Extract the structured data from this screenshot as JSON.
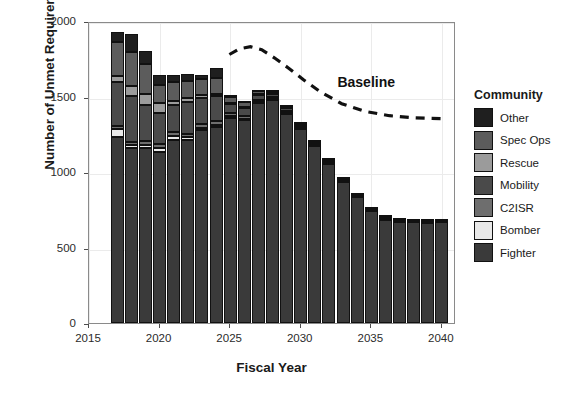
{
  "chart_data": {
    "type": "bar",
    "stacked": true,
    "title": "",
    "xlabel": "Fiscal Year",
    "ylabel": "Number of Unmet Requirements",
    "xlim": [
      2015.0,
      2041.0
    ],
    "ylim": [
      0,
      2000
    ],
    "xticks": [
      2015,
      2020,
      2025,
      2030,
      2035,
      2040
    ],
    "yticks": [
      0,
      500,
      1000,
      1500,
      2000
    ],
    "grid": true,
    "legend_title": "Community",
    "legend_position": "right",
    "categories": [
      2017,
      2018,
      2019,
      2020,
      2021,
      2022,
      2023,
      2024,
      2025,
      2026,
      2027,
      2028,
      2029,
      2030,
      2031,
      2032,
      2033,
      2034,
      2035,
      2036,
      2037,
      2038,
      2039,
      2040
    ],
    "series": [
      {
        "name": "Fighter",
        "color": "#3a3a3a",
        "values": [
          1235,
          1160,
          1160,
          1130,
          1215,
          1210,
          1280,
          1300,
          1360,
          1345,
          1460,
          1480,
          1390,
          1290,
          1180,
          1060,
          940,
          840,
          745,
          690,
          675,
          672,
          670,
          672
        ]
      },
      {
        "name": "Bomber",
        "color": "#e8e8e8",
        "values": [
          48,
          22,
          20,
          28,
          22,
          20,
          14,
          14,
          10,
          8,
          6,
          4,
          4,
          2,
          2,
          2,
          2,
          2,
          2,
          2,
          2,
          2,
          2,
          2
        ]
      },
      {
        "name": "C2ISR",
        "color": "#6e6e6e",
        "values": [
          22,
          18,
          26,
          30,
          26,
          24,
          22,
          22,
          18,
          16,
          14,
          12,
          10,
          8,
          6,
          6,
          4,
          4,
          4,
          4,
          4,
          4,
          4,
          4
        ]
      },
      {
        "name": "Mobility",
        "color": "#4a4a4a",
        "values": [
          290,
          305,
          235,
          205,
          180,
          210,
          175,
          165,
          60,
          52,
          30,
          22,
          18,
          14,
          12,
          10,
          8,
          6,
          6,
          6,
          4,
          4,
          4,
          4
        ]
      },
      {
        "name": "Rescue",
        "color": "#9b9b9b",
        "values": [
          40,
          62,
          78,
          66,
          30,
          26,
          18,
          16,
          12,
          10,
          8,
          6,
          6,
          4,
          4,
          4,
          2,
          2,
          2,
          2,
          2,
          2,
          2,
          2
        ]
      },
      {
        "name": "Spec Ops",
        "color": "#5c5c5c",
        "values": [
          225,
          230,
          195,
          120,
          120,
          110,
          105,
          105,
          38,
          30,
          18,
          14,
          10,
          8,
          6,
          6,
          4,
          4,
          4,
          4,
          4,
          4,
          4,
          4
        ]
      },
      {
        "name": "Other",
        "color": "#1f1f1f",
        "values": [
          70,
          118,
          86,
          61,
          47,
          50,
          26,
          68,
          12,
          10,
          8,
          6,
          6,
          4,
          4,
          4,
          4,
          4,
          4,
          4,
          4,
          4,
          4,
          4
        ]
      }
    ],
    "totals": [
      1930,
      1915,
      1800,
      1640,
      1640,
      1650,
      1640,
      1690,
      1510,
      1471,
      1544,
      1544,
      1444,
      1330,
      1214,
      1092,
      964,
      862,
      767,
      712,
      695,
      692,
      690,
      692
    ],
    "annotations": [
      {
        "name": "Baseline",
        "label": "Baseline",
        "style": "dashed-line",
        "color": "#111111",
        "x": [
          2025.0,
          2025.7,
          2026.5,
          2027.3,
          2028.2,
          2029.2,
          2030.3,
          2031.5,
          2033.0,
          2034.6,
          2036.4,
          2038.2,
          2040.3
        ],
        "y": [
          1790,
          1828,
          1842,
          1822,
          1768,
          1700,
          1620,
          1540,
          1462,
          1412,
          1382,
          1368,
          1362
        ],
        "label_x": 2032.6,
        "label_y": 1662
      }
    ]
  },
  "legend": {
    "title": "Community",
    "items": [
      {
        "label": "Other",
        "color": "#1f1f1f"
      },
      {
        "label": "Spec Ops",
        "color": "#5c5c5c"
      },
      {
        "label": "Rescue",
        "color": "#9b9b9b"
      },
      {
        "label": "Mobility",
        "color": "#4a4a4a"
      },
      {
        "label": "C2ISR",
        "color": "#6e6e6e"
      },
      {
        "label": "Bomber",
        "color": "#e8e8e8"
      },
      {
        "label": "Fighter",
        "color": "#3a3a3a"
      }
    ]
  }
}
